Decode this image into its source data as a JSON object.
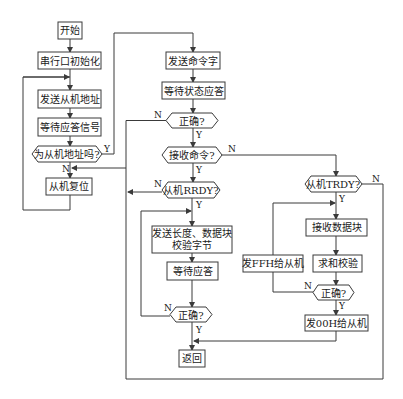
{
  "diagram": {
    "type": "flowchart",
    "nodes": {
      "start": "开始",
      "serial_init": "串行口初始化",
      "send_slave_addr": "发送从机地址",
      "wait_ack_signal": "等待应答信号",
      "is_slave_addr": "为从机地址吗?",
      "slave_reset": "从机复位",
      "send_cmd_word": "发送命令字",
      "wait_status_ack": "等待状态应答",
      "correct_1": "正确?",
      "receive_cmd": "接收命令?",
      "slave_rrdy": "从机RRDY?",
      "send_len_data_line1": "发送长度、数据块",
      "send_len_data_line2": "校验字节",
      "wait_ack": "等待应答",
      "correct_2": "正确?",
      "return": "返回",
      "slave_trdy": "从机TRDY?",
      "receive_data_block": "接收数据块",
      "checksum": "求和校验",
      "send_ffh": "发FFH给从机",
      "correct_3": "正确?",
      "send_00h": "发00H给从机"
    },
    "edge_labels": {
      "yes": "Y",
      "no": "N"
    },
    "colors": {
      "stroke": "#3a3a3a",
      "text": "#1a1a1a",
      "background": "#ffffff"
    }
  }
}
